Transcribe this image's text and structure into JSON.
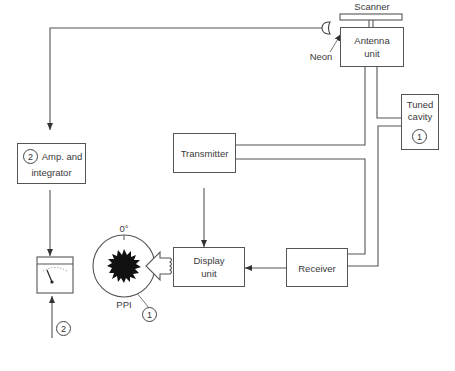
{
  "diagram": {
    "type": "radar block diagram",
    "blocks": {
      "scanner": "Scanner",
      "antenna_line1": "Antenna",
      "antenna_line2": "unit",
      "tuned_line1": "Tuned",
      "tuned_line2": "cavity",
      "transmitter": "Transmitter",
      "display_line1": "Display",
      "display_line2": "unit",
      "receiver": "Receiver",
      "amp_line1": "Amp. and",
      "amp_line2": "integrator"
    },
    "labels": {
      "neon": "Neon",
      "zero_deg": "0°",
      "ppi": "PPI"
    },
    "markers": {
      "tuned_cavity_num": "1",
      "amp_num": "2",
      "meter_num": "2",
      "ppi_num": "1"
    }
  }
}
